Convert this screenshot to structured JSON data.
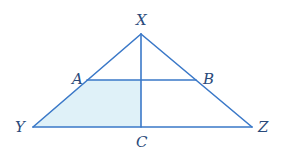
{
  "diagram": {
    "type": "geometry-triangle",
    "colors": {
      "stroke": "#3a78c8",
      "shade": "#dff1f8",
      "label": "#2a4a7a"
    },
    "points": {
      "X": {
        "label": "X",
        "x": 141,
        "y": 34
      },
      "Y": {
        "label": "Y",
        "x": 33,
        "y": 127
      },
      "Z": {
        "label": "Z",
        "x": 252,
        "y": 127
      },
      "A": {
        "label": "A",
        "x": 87,
        "y": 80
      },
      "B": {
        "label": "B",
        "x": 196,
        "y": 80
      },
      "C": {
        "label": "C",
        "x": 141,
        "y": 127
      }
    },
    "segments": [
      "XY",
      "XZ",
      "YZ",
      "AB",
      "XC"
    ],
    "shaded_region": "A-Y-C-(AB∩XC)"
  }
}
